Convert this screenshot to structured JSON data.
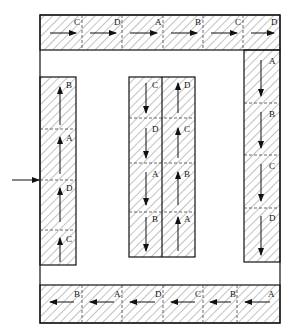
{
  "diagram": {
    "title": "",
    "colors": {
      "line": "#111111",
      "hatch": "#555555",
      "background": "#ffffff"
    },
    "entry_arrow": {
      "direction": "right",
      "target": "left-column"
    },
    "top_band": {
      "direction": "right",
      "labels": [
        "C",
        "D",
        "A",
        "B",
        "C",
        "D"
      ]
    },
    "bottom_band": {
      "direction": "left",
      "labels": [
        "B",
        "A",
        "D",
        "C",
        "B",
        "A"
      ]
    },
    "left_column": {
      "direction": "up",
      "labels": [
        "B",
        "A",
        "D",
        "C"
      ]
    },
    "right_column": {
      "direction": "down",
      "labels": [
        "A",
        "B",
        "C",
        "D"
      ]
    },
    "middle_left_column": {
      "direction": "down",
      "labels": [
        "C",
        "D",
        "A",
        "B"
      ]
    },
    "middle_right_column": {
      "direction": "up",
      "labels": [
        "D",
        "C",
        "B",
        "A"
      ]
    }
  }
}
